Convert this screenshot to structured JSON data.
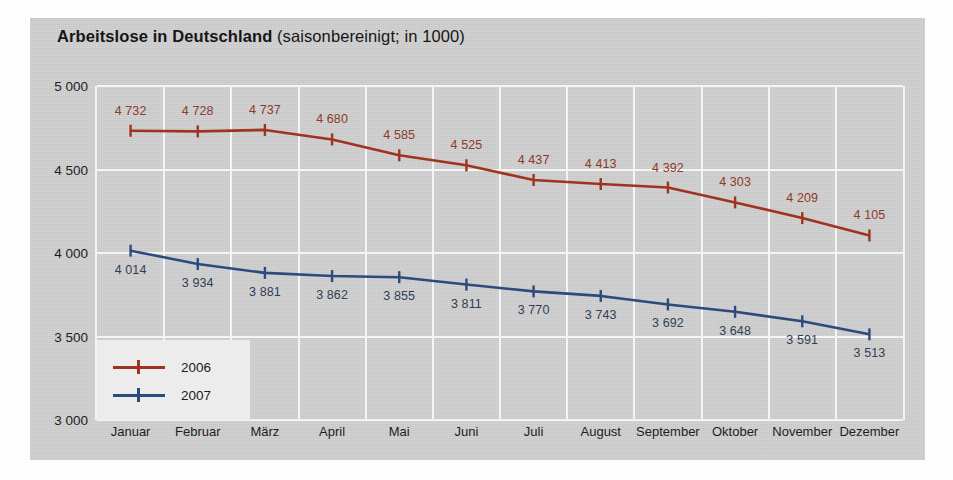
{
  "title": {
    "bold": "Arbeitslose in Deutschland",
    "rest": "(saisonbereinigt; in 1000)"
  },
  "colors": {
    "series_2006": "#9e3420",
    "series_2007": "#2c4a7c",
    "panel": "#cfcfcf",
    "gridline": "#f4f4f4",
    "legend_box": "#ececec"
  },
  "legend": {
    "entries": [
      {
        "label": "2006",
        "color": "#9e3420"
      },
      {
        "label": "2007",
        "color": "#2c4a7c"
      }
    ]
  },
  "chart_data": {
    "type": "line",
    "title": "Arbeitslose in Deutschland (saisonbereinigt; in 1000)",
    "xlabel": "",
    "ylabel": "",
    "ylim": [
      3000,
      5000
    ],
    "yticks": [
      3000,
      3500,
      4000,
      4500,
      5000
    ],
    "ytick_labels": [
      "3 000",
      "3 500",
      "4 000",
      "4 500",
      "5 000"
    ],
    "grid": true,
    "legend_position": "inside-bottom-left",
    "categories": [
      "Januar",
      "Februar",
      "März",
      "April",
      "Mai",
      "Juni",
      "Juli",
      "August",
      "September",
      "Oktober",
      "November",
      "Dezember"
    ],
    "series": [
      {
        "name": "2006",
        "color": "#9e3420",
        "values": [
          4732,
          4728,
          4737,
          4680,
          4585,
          4525,
          4437,
          4413,
          4392,
          4303,
          4209,
          4105
        ],
        "labels": [
          "4 732",
          "4 728",
          "4 737",
          "4 680",
          "4 585",
          "4 525",
          "4 437",
          "4 413",
          "4 392",
          "4 303",
          "4 209",
          "4 105"
        ]
      },
      {
        "name": "2007",
        "color": "#2c4a7c",
        "values": [
          4014,
          3934,
          3881,
          3862,
          3855,
          3811,
          3770,
          3743,
          3692,
          3648,
          3591,
          3513
        ],
        "labels": [
          "4 014",
          "3 934",
          "3 881",
          "3 862",
          "3 855",
          "3 811",
          "3 770",
          "3 743",
          "3 692",
          "3 648",
          "3 591",
          "3 513"
        ]
      }
    ]
  }
}
